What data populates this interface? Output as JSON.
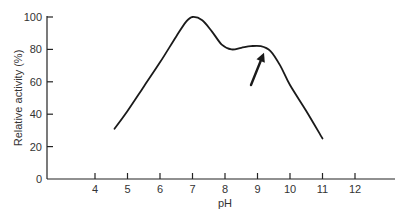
{
  "chart_data": {
    "type": "line",
    "title": "",
    "xlabel": "pH",
    "ylabel": "Relative activity (%)",
    "xlim": [
      2.5,
      13.5
    ],
    "ylim": [
      0,
      100
    ],
    "x_ticks": [
      4,
      5,
      6,
      7,
      8,
      9,
      10,
      11,
      12
    ],
    "y_ticks": [
      0,
      20,
      40,
      60,
      80,
      100
    ],
    "grid": false,
    "legend": null,
    "series": [
      {
        "name": "Relative activity",
        "x": [
          4.6,
          5.0,
          5.5,
          6.0,
          6.5,
          6.8,
          7.0,
          7.3,
          7.6,
          7.9,
          8.2,
          8.5,
          8.8,
          9.1,
          9.4,
          9.7,
          10.0,
          10.5,
          11.0
        ],
        "y": [
          31,
          42,
          57,
          72,
          88,
          97,
          100,
          98,
          91,
          83,
          80,
          81,
          82,
          82,
          79,
          70,
          58,
          42,
          25
        ]
      }
    ],
    "annotations": [
      {
        "type": "arrow",
        "points_to": {
          "x": 9.2,
          "y": 78
        },
        "from": {
          "x": 8.8,
          "y": 58
        }
      }
    ]
  }
}
